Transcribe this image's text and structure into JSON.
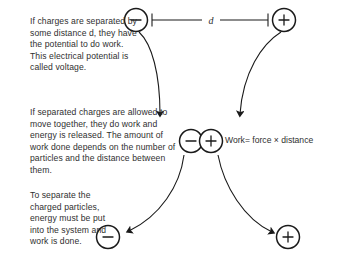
{
  "figure": {
    "background_color": "#ffffff",
    "ink_color": "#1a1a1a",
    "text_color": "#2f2f2f",
    "paragraphs": {
      "voltage": "If charges are separated by some distance d, they have the potential to do work. This electrical potential is called voltage.",
      "work_released": "If separated charges are allowed to move together, they do work and energy is released. The amount of work done depends on the number of particles and the distance between them.",
      "separation": "To separate the charged particles, energy must be put into the system and work is done."
    },
    "equation": {
      "label": "Work= force × distance"
    },
    "dimension": {
      "label": "d"
    },
    "charges": {
      "top_negative": "−",
      "top_positive": "+",
      "paired_negative": "−",
      "paired_positive": "+",
      "bottom_negative": "−",
      "bottom_positive": "+"
    }
  }
}
